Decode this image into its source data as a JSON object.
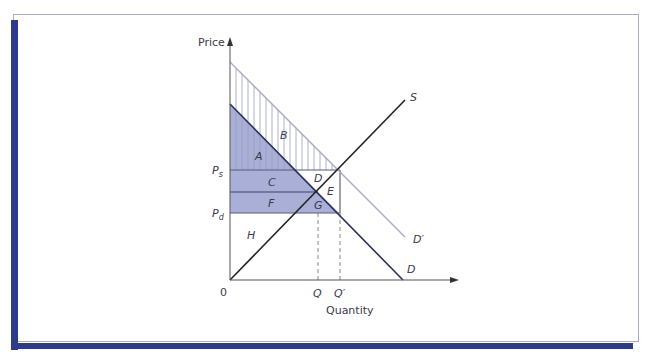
{
  "figure": {
    "axis": {
      "y_label": "Price",
      "x_label": "Quantity",
      "origin_label": "0"
    },
    "curves": {
      "supply_label": "S",
      "demand_label": "D",
      "shifted_demand_label": "D′"
    },
    "price_ticks": {
      "ps_main": "P",
      "ps_sub": "s",
      "pd_main": "P",
      "pd_sub": "d"
    },
    "quantity_ticks": {
      "q": "Q",
      "q_prime": "Q′"
    },
    "areas": {
      "a": "A",
      "b": "B",
      "c": "C",
      "d": "D",
      "e": "E",
      "f": "F",
      "g": "G",
      "h": "H"
    },
    "colors": {
      "frame_accent": "#2e3a8c",
      "shade_fill": "#a9afd6",
      "demand_line": "#2b2f5c",
      "shifted_demand_line": "#a6aac8",
      "supply_line": "#222222"
    }
  }
}
